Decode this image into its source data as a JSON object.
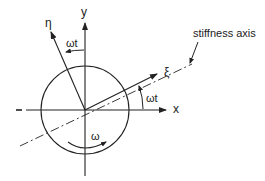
{
  "diagram": {
    "labels": {
      "y_axis": "y",
      "x_axis": "x",
      "eta_axis": "η",
      "xi_axis": "ξ",
      "angle_top": "ωt",
      "angle_right": "ωt",
      "rotation": "ω",
      "stiffness_axis": "stiffness axis"
    },
    "colors": {
      "stroke": "#222222",
      "background": "#ffffff"
    }
  }
}
